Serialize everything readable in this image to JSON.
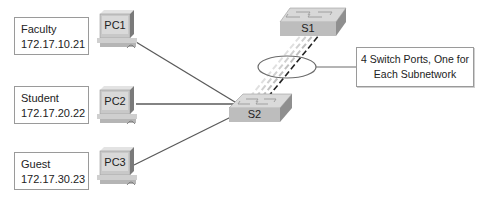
{
  "diagram": {
    "hosts": [
      {
        "id": "PC1",
        "label": "PC1",
        "group": "Faculty",
        "ip": "172.17.10.21"
      },
      {
        "id": "PC2",
        "label": "PC2",
        "group": "Student",
        "ip": "172.17.20.22"
      },
      {
        "id": "PC3",
        "label": "PC3",
        "group": "Guest",
        "ip": "172.17.30.23"
      }
    ],
    "switches": [
      {
        "id": "S1",
        "label": "S1"
      },
      {
        "id": "S2",
        "label": "S2"
      }
    ],
    "links": [
      {
        "from": "PC1",
        "to": "S2",
        "style": "solid"
      },
      {
        "from": "PC2",
        "to": "S2",
        "style": "solid"
      },
      {
        "from": "PC3",
        "to": "S2",
        "style": "solid"
      },
      {
        "from": "S2",
        "to": "S1",
        "style": "dashed",
        "count": 4
      }
    ],
    "callout": {
      "line1": "4 Switch Ports, One for",
      "line2": "Each Subnetwork"
    },
    "colors": {
      "link": "#5a5a5a",
      "switch_top": "#d8d8d8",
      "switch_front": "#bdbdbd",
      "pc_body": "#c8c8c8",
      "pc_screen": "#d9d9d9",
      "ellipse": "#6b6b6b"
    }
  }
}
